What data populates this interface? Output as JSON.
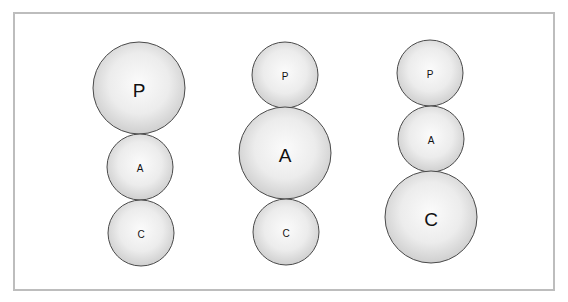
{
  "diagram": {
    "colors": {
      "frame_border": "#bdbdbd",
      "circle_outline": "#4a4a4a",
      "circle_fill_center": "#fbfbfb",
      "circle_fill_edge": "#cfcfcf",
      "label": "#111111"
    },
    "columns": [
      {
        "name": "column-1",
        "emphasis": "P",
        "circles": [
          {
            "label": "P",
            "size": "large",
            "cx": 139,
            "cy": 88,
            "r": 46
          },
          {
            "label": "A",
            "size": "small",
            "cx": 140,
            "cy": 167,
            "r": 33
          },
          {
            "label": "C",
            "size": "small",
            "cx": 141,
            "cy": 233,
            "r": 33
          }
        ]
      },
      {
        "name": "column-2",
        "emphasis": "A",
        "circles": [
          {
            "label": "P",
            "size": "small",
            "cx": 285,
            "cy": 75,
            "r": 33
          },
          {
            "label": "A",
            "size": "large",
            "cx": 285,
            "cy": 153,
            "r": 46
          },
          {
            "label": "C",
            "size": "small",
            "cx": 286,
            "cy": 232,
            "r": 33
          }
        ]
      },
      {
        "name": "column-3",
        "emphasis": "C",
        "circles": [
          {
            "label": "P",
            "size": "small",
            "cx": 430,
            "cy": 73,
            "r": 33
          },
          {
            "label": "A",
            "size": "small",
            "cx": 431,
            "cy": 139,
            "r": 33
          },
          {
            "label": "C",
            "size": "large",
            "cx": 431,
            "cy": 217,
            "r": 46
          }
        ]
      }
    ]
  }
}
